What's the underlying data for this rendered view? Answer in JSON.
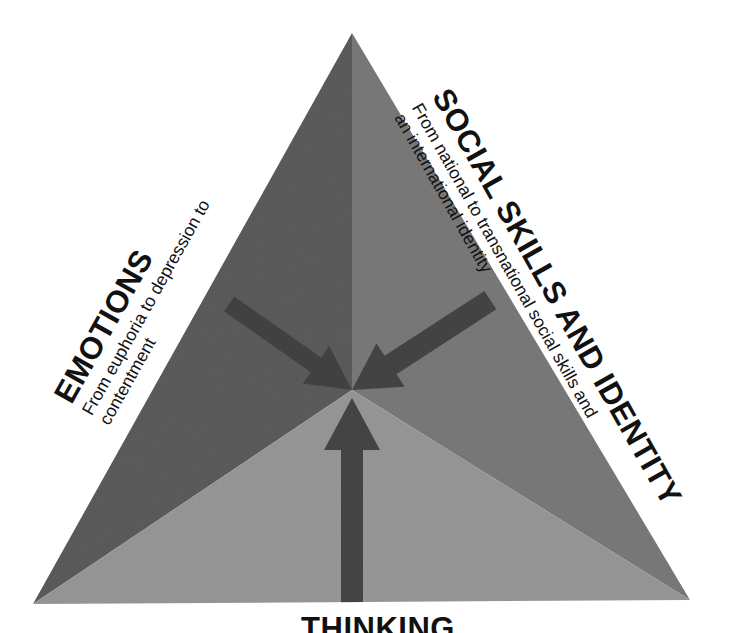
{
  "diagram": {
    "type": "triangle-segments",
    "background_color": "#ffffff",
    "geometry": {
      "apex": [
        352,
        33
      ],
      "bottom_left": [
        33,
        604
      ],
      "bottom_right": [
        690,
        600
      ],
      "center": [
        352,
        390
      ]
    },
    "segments": [
      {
        "id": "emotions",
        "title": "EMOTIONS",
        "subtitle": "From euphoria to depression to contentment",
        "fill_color": "#5b5b5b",
        "position": "upper-left"
      },
      {
        "id": "social-skills-and-identity",
        "title": "SOCIAL SKILLS AND IDENTITY",
        "subtitle": "From national to transnational social skills and an international identity",
        "fill_color": "#797979",
        "position": "upper-right"
      },
      {
        "id": "thinking",
        "title": "THINKING",
        "subtitle": "",
        "fill_color": "#979797",
        "position": "bottom"
      }
    ],
    "arrows": [
      {
        "id": "arrow-emotions-to-center",
        "from": "emotions",
        "to": "center",
        "direction": "down-right",
        "color": "#3d3d3d"
      },
      {
        "id": "arrow-social-to-center",
        "from": "social-skills-and-identity",
        "to": "center",
        "direction": "down-left",
        "color": "#3d3d3d"
      },
      {
        "id": "arrow-thinking-to-center",
        "from": "thinking",
        "to": "center",
        "direction": "up",
        "color": "#3d3d3d"
      }
    ],
    "labels": {
      "emotions": {
        "title": "EMOTIONS",
        "sub_line_1": "From euphoria to depression to",
        "sub_line_2": "contentment"
      },
      "social": {
        "title": "SOCIAL SKILLS AND IDENTITY",
        "sub_line_1": "From national to transnational social skills and",
        "sub_line_2": "an international identity"
      },
      "thinking": {
        "title": "THINKING"
      }
    }
  }
}
